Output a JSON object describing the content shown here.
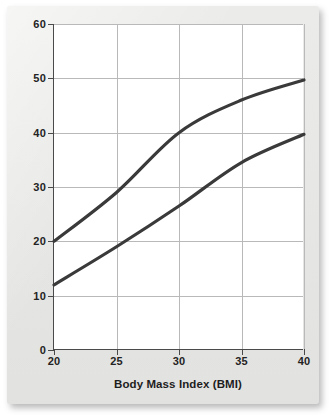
{
  "figure": {
    "kind": "line-chart",
    "background_color": "#e9e9e7",
    "plot_background_color": "#ffffff",
    "axis_color": "#4a4a4a",
    "grid_color": "#b9b9b9",
    "line_color": "#3a3a3a"
  },
  "chart_data": {
    "type": "line",
    "title": "",
    "xlabel": "Body Mass Index (BMI)",
    "ylabel": "Percent Body Fat",
    "xlim": [
      20,
      40
    ],
    "ylim": [
      0,
      60
    ],
    "xticks": [
      20,
      25,
      30,
      35,
      40
    ],
    "yticks": [
      0,
      10,
      20,
      30,
      40,
      50,
      60
    ],
    "xtick_labels": [
      "20",
      "25",
      "30",
      "35",
      "40"
    ],
    "ytick_labels": [
      "0",
      "10",
      "20",
      "30",
      "40",
      "50",
      "60"
    ],
    "grid": true,
    "legend": "none",
    "x": [
      20,
      25,
      30,
      35,
      40
    ],
    "series": [
      {
        "name": "upper-curve",
        "values": [
          20.0,
          29.0,
          40.0,
          46.0,
          49.7
        ],
        "color": "#3a3a3a"
      },
      {
        "name": "lower-curve",
        "values": [
          12.0,
          19.0,
          26.5,
          34.5,
          39.7
        ],
        "color": "#3a3a3a"
      }
    ]
  }
}
